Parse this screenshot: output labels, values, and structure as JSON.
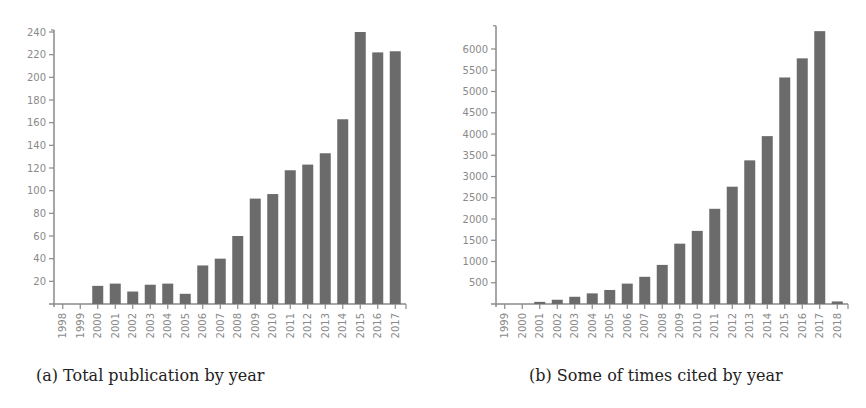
{
  "chart_data": [
    {
      "id": "a",
      "type": "bar",
      "title": "",
      "caption": "(a) Total publication by year",
      "xlabel": "",
      "ylabel": "",
      "categories": [
        "1998",
        "1999",
        "2000",
        "2001",
        "2002",
        "2003",
        "2004",
        "2005",
        "2006",
        "2007",
        "2008",
        "2009",
        "2010",
        "2011",
        "2012",
        "2013",
        "2014",
        "2015",
        "2016",
        "2017"
      ],
      "values": [
        0,
        0,
        16,
        18,
        11,
        17,
        18,
        9,
        34,
        40,
        60,
        93,
        97,
        118,
        123,
        133,
        163,
        240,
        222,
        223
      ],
      "yticks": [
        20,
        40,
        60,
        80,
        100,
        120,
        140,
        160,
        180,
        200,
        220,
        240
      ],
      "ylim": [
        0,
        240
      ],
      "grid": false,
      "legend": null,
      "bar_color": "#6b6b6b"
    },
    {
      "id": "b",
      "type": "bar",
      "title": "",
      "caption": "(b) Some of times cited by year",
      "xlabel": "",
      "ylabel": "",
      "categories": [
        "1999",
        "2000",
        "2001",
        "2002",
        "2003",
        "2004",
        "2005",
        "2006",
        "2007",
        "2008",
        "2009",
        "2010",
        "2011",
        "2012",
        "2013",
        "2014",
        "2015",
        "2016",
        "2017",
        "2018"
      ],
      "values": [
        0,
        0,
        50,
        100,
        170,
        250,
        330,
        480,
        640,
        920,
        1420,
        1720,
        2240,
        2760,
        3380,
        3950,
        5330,
        5780,
        6420,
        60
      ],
      "yticks": [
        500,
        1000,
        1500,
        2000,
        2500,
        3000,
        3500,
        4000,
        4500,
        5000,
        5500,
        6000
      ],
      "ylim": [
        0,
        6500
      ],
      "grid": false,
      "legend": null,
      "bar_color": "#6b6b6b"
    }
  ],
  "captions": {
    "a": "(a) Total publication by year",
    "b": "(b) Some of times cited by year"
  },
  "colors": {
    "bar": "#6b6b6b",
    "axis": "#8a8a8a",
    "tick_text": "#8a8a8a",
    "caption_text": "#222222"
  }
}
